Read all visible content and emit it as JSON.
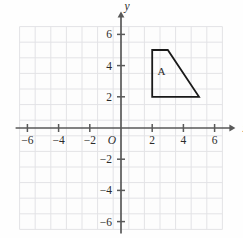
{
  "figure": {
    "background_color": "#fefefe",
    "grid_color": "#e3e3e6",
    "axis_color": "#595959",
    "shape_stroke_color": "#1a1a1a",
    "text_color": "#2b2b2b"
  },
  "axes": {
    "x_axis_label": "x",
    "y_axis_label": "y",
    "origin_label": "O",
    "x_ticks": [
      {
        "value": -6,
        "label": "−6"
      },
      {
        "value": -4,
        "label": "−4"
      },
      {
        "value": -2,
        "label": "−2"
      },
      {
        "value": 2,
        "label": "2"
      },
      {
        "value": 4,
        "label": "4"
      },
      {
        "value": 6,
        "label": "6"
      }
    ],
    "y_ticks": [
      {
        "value": 6,
        "label": "6"
      },
      {
        "value": 4,
        "label": "4"
      },
      {
        "value": 2,
        "label": "2"
      },
      {
        "value": -2,
        "label": "−2"
      },
      {
        "value": -4,
        "label": "−4"
      },
      {
        "value": -6,
        "label": "−6"
      }
    ]
  },
  "chart_data": {
    "type": "scatter",
    "title": "",
    "xlabel": "x",
    "ylabel": "y",
    "xlim": [
      -6.5,
      6.5
    ],
    "ylim": [
      -6.5,
      6.5
    ],
    "grid": true,
    "grid_step": 1,
    "tick_step": 2,
    "legend": "none",
    "shapes": [
      {
        "name": "A",
        "label": "A",
        "type": "polygon",
        "vertices": [
          [
            2,
            5
          ],
          [
            3,
            5
          ],
          [
            5,
            2
          ],
          [
            2,
            2
          ]
        ],
        "label_position": [
          2.6,
          3.4
        ],
        "fill": "none",
        "stroke": "#1a1a1a"
      }
    ]
  }
}
